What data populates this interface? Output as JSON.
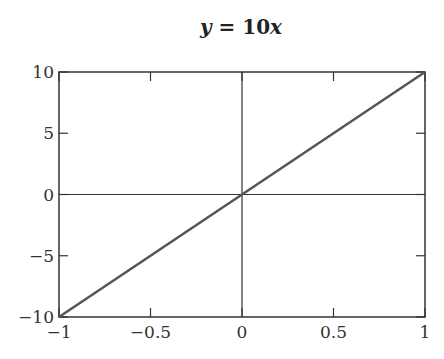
{
  "chart_data": {
    "type": "line",
    "title": "y = 10x",
    "title_parts": {
      "y": "y",
      "eq": " = 10",
      "x": "x"
    },
    "xlabel": "",
    "ylabel": "",
    "xlim": [
      -1,
      1
    ],
    "ylim": [
      -10,
      10
    ],
    "grid": false,
    "axes_lines": {
      "x0": true,
      "y0": true
    },
    "x_ticks": [
      -1,
      -0.5,
      0,
      0.5,
      1
    ],
    "x_tick_labels": [
      "−1",
      "−0.5",
      "0",
      "0.5",
      "1"
    ],
    "y_ticks": [
      -10,
      -5,
      0,
      5,
      10
    ],
    "y_tick_labels": [
      "−10",
      "−5",
      "0",
      "5",
      "10"
    ],
    "series": [
      {
        "name": "y = 10x",
        "x": [
          -1,
          -0.5,
          0,
          0.5,
          1
        ],
        "y": [
          -10,
          -5,
          0,
          5,
          10
        ],
        "color": "#555555"
      }
    ]
  }
}
